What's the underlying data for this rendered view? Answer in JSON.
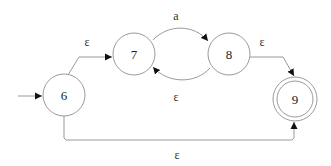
{
  "diagram": {
    "type": "nfa-state-diagram",
    "start_state": "6",
    "accept_states": [
      "9"
    ],
    "nodes": [
      {
        "id": "6",
        "label": "6",
        "accepting": false
      },
      {
        "id": "7",
        "label": "7",
        "accepting": false
      },
      {
        "id": "8",
        "label": "8",
        "accepting": false
      },
      {
        "id": "9",
        "label": "9",
        "accepting": true
      }
    ],
    "edges": [
      {
        "from": "6",
        "to": "7",
        "label": "ε"
      },
      {
        "from": "7",
        "to": "8",
        "label": "a"
      },
      {
        "from": "8",
        "to": "7",
        "label": "ε"
      },
      {
        "from": "8",
        "to": "9",
        "label": "ε"
      },
      {
        "from": "6",
        "to": "9",
        "label": "ε"
      }
    ],
    "colors": {
      "stroke": "#9a9a9a",
      "arrowhead": "#111111",
      "text": "#222222"
    }
  }
}
